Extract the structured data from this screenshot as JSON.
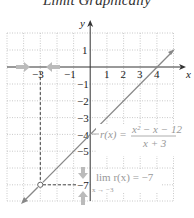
{
  "title": "Limit Graphically",
  "axes": {
    "x_label": "x",
    "y_label": "y"
  },
  "x_ticks": [
    {
      "value": -3,
      "label": "−3"
    },
    {
      "value": -1,
      "label": "−1"
    },
    {
      "value": 1,
      "label": "1"
    },
    {
      "value": 2,
      "label": "2"
    },
    {
      "value": 3,
      "label": "3"
    },
    {
      "value": 4,
      "label": "4"
    }
  ],
  "y_ticks": [
    {
      "value": 1,
      "label": "1"
    },
    {
      "value": -1,
      "label": "−1"
    },
    {
      "value": -2,
      "label": "−2"
    },
    {
      "value": -3,
      "label": "−3"
    },
    {
      "value": -4,
      "label": "−4"
    },
    {
      "value": -5,
      "label": "−5"
    },
    {
      "value": -7,
      "label": "−7"
    }
  ],
  "function_label": {
    "lhs": "r(x) =",
    "numerator": "x² − x − 12",
    "denominator": "x + 3"
  },
  "limit_label": {
    "text": "lim r(x) = −7",
    "subscript": "x → −3"
  },
  "hole": {
    "x": -3,
    "y": -7
  },
  "colors": {
    "line": "#888888",
    "grid": "#bbbbbb",
    "axis": "#333333",
    "arrow": "#bbbbbb"
  }
}
